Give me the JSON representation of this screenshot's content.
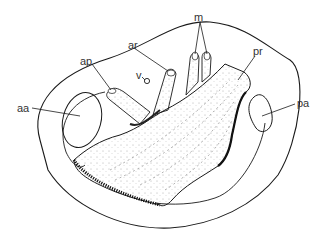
{
  "figure": {
    "type": "anatomical line drawing",
    "colors": {
      "ink": "#1a1a1a",
      "label": "#333333",
      "background": "#ffffff"
    },
    "labels": [
      {
        "id": "aa",
        "text": "aa",
        "x": 17,
        "y": 103
      },
      {
        "id": "ap",
        "text": "ap",
        "x": 80,
        "y": 56
      },
      {
        "id": "ar",
        "text": "ar",
        "x": 128,
        "y": 40
      },
      {
        "id": "v",
        "text": "v",
        "x": 136,
        "y": 73
      },
      {
        "id": "m",
        "text": "m",
        "x": 194,
        "y": 14
      },
      {
        "id": "pr",
        "text": "pr",
        "x": 253,
        "y": 48
      },
      {
        "id": "pa",
        "text": "pa",
        "x": 297,
        "y": 100
      }
    ]
  }
}
